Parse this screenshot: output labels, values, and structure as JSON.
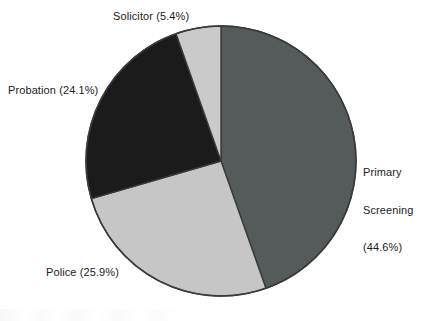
{
  "chart_data": {
    "type": "pie",
    "title": "",
    "subtitle": "",
    "xlabel": "",
    "ylabel": "",
    "legend_position": "none",
    "grid": false,
    "labels_outside": true,
    "start_angle_deg": 0,
    "direction": "clockwise",
    "categories": [
      "Primary Screening",
      "Police",
      "Probation",
      "Solicitor"
    ],
    "values": [
      44.6,
      25.9,
      24.1,
      5.4
    ],
    "unit": "%",
    "slices": [
      {
        "name": "Primary Screening",
        "value": 44.6,
        "label": "Primary Screening (44.6%)",
        "label_lines": [
          "Primary",
          "Screening",
          "(44.6%)"
        ],
        "color": "#555a5a",
        "start_deg": 0,
        "end_deg": 160.56
      },
      {
        "name": "Police",
        "value": 25.9,
        "label": "Police (25.9%)",
        "label_lines": [
          "Police (25.9%)"
        ],
        "color": "#c5c6c5",
        "start_deg": 160.56,
        "end_deg": 253.8
      },
      {
        "name": "Probation",
        "value": 24.1,
        "label": "Probation (24.1%)",
        "label_lines": [
          "Probation (24.1%)"
        ],
        "color": "#1b1b1b",
        "start_deg": 253.8,
        "end_deg": 340.56
      },
      {
        "name": "Solicitor",
        "value": 5.4,
        "label": "Solicitor (5.4%)",
        "label_lines": [
          "Solicitor (5.4%)"
        ],
        "color": "#c9cac9",
        "start_deg": 340.56,
        "end_deg": 360
      }
    ],
    "outline_color": "#3a3a3a",
    "background_color": "#ffffff",
    "text_color": "#1b1b1b"
  },
  "labels": {
    "solicitor": "Solicitor (5.4%)",
    "probation": "Probation (24.1%)",
    "police": "Police (25.9%)",
    "primary_line1": "Primary",
    "primary_line2": "Screening",
    "primary_line3": "(44.6%)"
  }
}
